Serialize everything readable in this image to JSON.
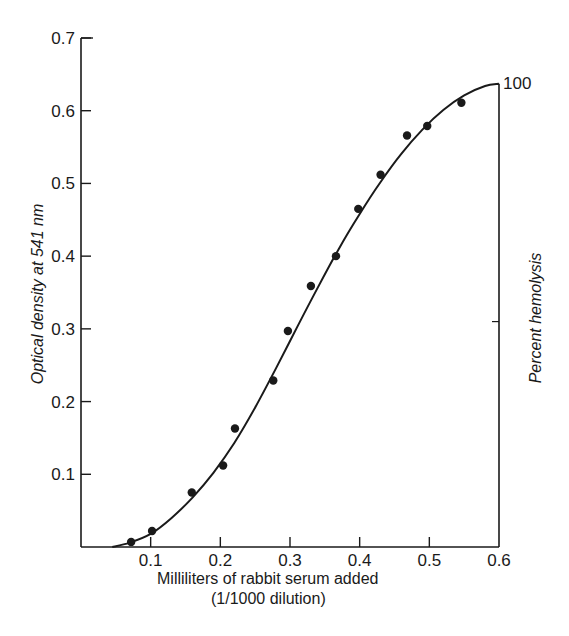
{
  "chart_data": {
    "type": "scatter",
    "title": "",
    "xlabel": "Milliliters of rabbit serum added",
    "xlabel_line2": "(1/1000 dilution)",
    "ylabel": "Optical density at 541 nm",
    "ylabel_right": "Percent hemolysis",
    "xlim": [
      0,
      0.6
    ],
    "ylim": [
      0,
      0.7
    ],
    "x_ticks": [
      0.1,
      0.2,
      0.3,
      0.4,
      0.5,
      0.6
    ],
    "x_tick_labels": [
      "0.1",
      "0.2",
      "0.3",
      "0.4",
      "0.5",
      "0.6"
    ],
    "y_ticks": [
      0.1,
      0.2,
      0.3,
      0.4,
      0.5,
      0.6,
      0.7
    ],
    "y_tick_labels": [
      "0.1",
      "0.2",
      "0.3",
      "0.4",
      "0.5",
      "0.6",
      "0.7"
    ],
    "right_axis": {
      "label": "Percent hemolysis",
      "top_label": "100",
      "top_value_od": 0.637,
      "mid_tick_od": 0.31
    },
    "grid": false,
    "legend": null,
    "series": [
      {
        "name": "Measured points",
        "kind": "scatter",
        "x": [
          0.072,
          0.102,
          0.159,
          0.204,
          0.221,
          0.276,
          0.297,
          0.33,
          0.366,
          0.398,
          0.43,
          0.468,
          0.497,
          0.546
        ],
        "y": [
          0.007,
          0.022,
          0.075,
          0.112,
          0.163,
          0.229,
          0.297,
          0.359,
          0.4,
          0.465,
          0.512,
          0.566,
          0.579,
          0.611
        ]
      },
      {
        "name": "Fitted sigmoid curve",
        "kind": "line",
        "x": [
          0.045,
          0.07,
          0.1,
          0.13,
          0.16,
          0.19,
          0.22,
          0.25,
          0.28,
          0.31,
          0.34,
          0.37,
          0.4,
          0.43,
          0.46,
          0.49,
          0.52,
          0.55,
          0.58,
          0.6
        ],
        "y": [
          0.0,
          0.006,
          0.018,
          0.04,
          0.068,
          0.102,
          0.143,
          0.192,
          0.246,
          0.302,
          0.357,
          0.41,
          0.458,
          0.502,
          0.541,
          0.574,
          0.601,
          0.621,
          0.634,
          0.637
        ]
      }
    ]
  }
}
